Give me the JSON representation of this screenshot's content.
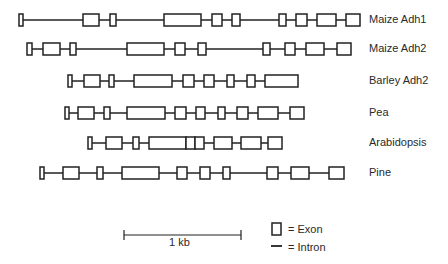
{
  "genes": [
    {
      "name": "Maize Adh1",
      "y": 20,
      "start": 19,
      "end": 360,
      "exons": [
        [
          19,
          23
        ],
        [
          83,
          99
        ],
        [
          110,
          116
        ],
        [
          164,
          201
        ],
        [
          212,
          222
        ],
        [
          232,
          240
        ],
        [
          279,
          286
        ],
        [
          296,
          307
        ],
        [
          317,
          336
        ],
        [
          346,
          360
        ]
      ]
    },
    {
      "name": "Maize Adh2",
      "y": 49,
      "start": 27,
      "end": 351,
      "exons": [
        [
          27,
          32
        ],
        [
          43,
          60
        ],
        [
          70,
          76
        ],
        [
          127,
          164
        ],
        [
          175,
          185
        ],
        [
          198,
          206
        ],
        [
          263,
          270
        ],
        [
          285,
          295
        ],
        [
          306,
          324
        ],
        [
          337,
          351
        ]
      ]
    },
    {
      "name": "Barley Adh2",
      "y": 81,
      "start": 68,
      "end": 298,
      "exons": [
        [
          68,
          72
        ],
        [
          84,
          100
        ],
        [
          109,
          114
        ],
        [
          134,
          172
        ],
        [
          183,
          194
        ],
        [
          204,
          214
        ],
        [
          227,
          234
        ],
        [
          247,
          255
        ],
        [
          265,
          298
        ]
      ]
    },
    {
      "name": "Pea",
      "y": 113,
      "start": 65,
      "end": 304,
      "exons": [
        [
          65,
          69
        ],
        [
          78,
          94
        ],
        [
          104,
          110
        ],
        [
          127,
          165
        ],
        [
          175,
          186
        ],
        [
          196,
          205
        ],
        [
          218,
          225
        ],
        [
          237,
          248
        ],
        [
          258,
          278
        ],
        [
          290,
          304
        ]
      ]
    },
    {
      "name": "Arabidopsis",
      "y": 143,
      "start": 88,
      "end": 282,
      "exons": [
        [
          88,
          92
        ],
        [
          106,
          122
        ],
        [
          133,
          139
        ],
        [
          149,
          186
        ],
        [
          186,
          195
        ],
        [
          195,
          204
        ],
        [
          214,
          232
        ],
        [
          241,
          261
        ],
        [
          268,
          282
        ]
      ]
    },
    {
      "name": "Pine",
      "y": 173,
      "start": 40,
      "end": 344,
      "exons": [
        [
          40,
          44
        ],
        [
          63,
          79
        ],
        [
          97,
          103
        ],
        [
          122,
          159
        ],
        [
          177,
          187
        ],
        [
          200,
          210
        ],
        [
          223,
          230
        ],
        [
          267,
          278
        ],
        [
          291,
          309
        ],
        [
          329,
          344
        ]
      ]
    }
  ],
  "scale_bar": {
    "label": "1 kb",
    "x1": 124,
    "x2": 241,
    "y": 235
  },
  "legend": {
    "exon_label": "= Exon",
    "intron_label": "= Intron"
  },
  "colors": {
    "stroke": "#222222",
    "text": "#2a2a2a",
    "exon_fill": "#ffffff"
  }
}
